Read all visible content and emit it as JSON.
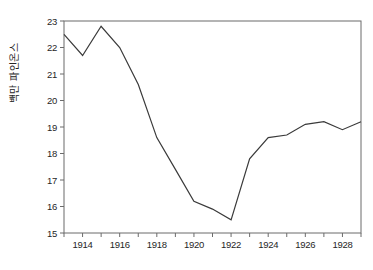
{
  "figure": {
    "background": "#ffffff",
    "frame_color": "#6b6b6b",
    "line_color": "#3a3a3a",
    "text_color": "#262626",
    "tick_length": 4
  },
  "chart_data": {
    "type": "line",
    "title": "",
    "xlabel": "",
    "ylabel": "백만 파인온스",
    "x": [
      1913,
      1914,
      1915,
      1916,
      1917,
      1918,
      1919,
      1920,
      1921,
      1922,
      1923,
      1924,
      1925,
      1926,
      1927,
      1928,
      1929
    ],
    "values": [
      22.5,
      21.7,
      22.8,
      22.0,
      20.6,
      18.6,
      17.4,
      16.2,
      15.9,
      15.5,
      17.8,
      18.6,
      18.7,
      19.1,
      19.2,
      18.9,
      19.2
    ],
    "series_name": "",
    "xlim": [
      1913,
      1929
    ],
    "ylim": [
      15,
      23
    ],
    "x_ticks_all": [
      1913,
      1914,
      1915,
      1916,
      1917,
      1918,
      1919,
      1920,
      1921,
      1922,
      1923,
      1924,
      1925,
      1926,
      1927,
      1928,
      1929
    ],
    "x_tick_labels": [
      "1914",
      "1916",
      "1918",
      "1920",
      "1922",
      "1924",
      "1926",
      "1928"
    ],
    "x_labeled_ticks": [
      1914,
      1916,
      1918,
      1920,
      1922,
      1924,
      1926,
      1928
    ],
    "y_ticks": [
      15,
      16,
      17,
      18,
      19,
      20,
      21,
      22,
      23
    ],
    "y_tick_labels": [
      "15",
      "16",
      "17",
      "18",
      "19",
      "20",
      "21",
      "22",
      "23"
    ],
    "grid": false,
    "legend_position": "none",
    "frame": "full-box"
  }
}
